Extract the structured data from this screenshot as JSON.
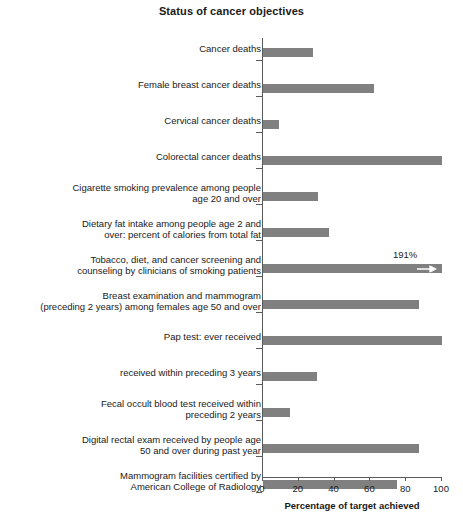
{
  "chart_data": {
    "type": "bar",
    "orientation": "horizontal",
    "title": "Status of cancer objectives",
    "xlabel": "Percentage of target achieved",
    "ylabel": "",
    "xlim": [
      0,
      100
    ],
    "xticks": [
      0,
      20,
      40,
      60,
      80,
      100
    ],
    "xtick_labels": [
      "0",
      "20",
      "40",
      "60",
      "80",
      "100"
    ],
    "grid": false,
    "legend": null,
    "bar_color": "#808080",
    "axis_color": "#5a5a5a",
    "categories": [
      "Cancer deaths",
      "Female breast cancer deaths",
      "Cervical cancer deaths",
      "Colorectal cancer deaths",
      "Cigarette smoking prevalence among people\nage 20 and over",
      "Dietary fat intake among people age 2 and\nover: percent of calories from total fat",
      "Tobacco, diet, and cancer screening and\ncounseling by clinicians of smoking patients",
      "Breast examination and mammogram\n(preceding 2 years) among females age 50 and over",
      "Pap test: ever received",
      "received within preceding 3 years",
      "Fecal occult blood test received within\npreceding 2 years",
      "Digital rectal exam received by people age\n50 and over during past year",
      "Mammogram facilities certified by\nAmerican College of Radiology"
    ],
    "values": [
      28,
      62,
      9,
      100,
      31,
      37,
      191,
      87,
      100,
      30,
      15,
      87,
      75
    ],
    "annotations": [
      {
        "category": "Tobacco, diet, and cancer screening and counseling by clinicians of smoking patients",
        "text": "191%",
        "note": "bar exceeds axis maximum; drawn clipped at 100 with right-pointing arrow"
      }
    ]
  }
}
